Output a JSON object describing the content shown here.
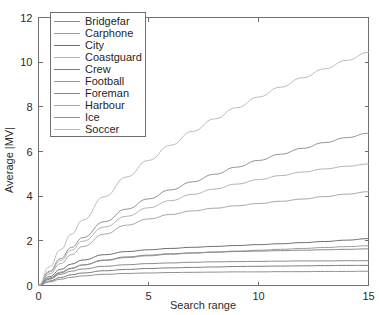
{
  "chart_data": {
    "type": "line",
    "title": "",
    "xlabel": "Search range",
    "ylabel": "Average |MV|",
    "xlim": [
      0,
      15
    ],
    "ylim": [
      0,
      12
    ],
    "xticks": [
      0,
      5,
      10,
      15
    ],
    "yticks": [
      0,
      2,
      4,
      6,
      8,
      10,
      12
    ],
    "grid": false,
    "legend_position": "upper-left-inside",
    "x": [
      0,
      0.5,
      1,
      1.5,
      2,
      3,
      4,
      5,
      6,
      7,
      8,
      9,
      10,
      11,
      12,
      13,
      14,
      15
    ],
    "series": [
      {
        "name": "Bridgefar",
        "color": "#8a8a8a",
        "values": [
          0,
          0.28,
          0.5,
          0.64,
          0.74,
          0.86,
          0.93,
          0.98,
          1.01,
          1.04,
          1.06,
          1.07,
          1.08,
          1.09,
          1.1,
          1.1,
          1.11,
          1.11
        ]
      },
      {
        "name": "Carphone",
        "color": "#9d9d9d",
        "values": [
          0,
          0.34,
          0.6,
          0.78,
          0.92,
          1.12,
          1.25,
          1.33,
          1.4,
          1.45,
          1.5,
          1.54,
          1.58,
          1.62,
          1.66,
          1.7,
          1.74,
          1.78
        ]
      },
      {
        "name": "City",
        "color": "#6e6e6e",
        "values": [
          0,
          0.4,
          0.72,
          0.96,
          1.14,
          1.38,
          1.52,
          1.6,
          1.66,
          1.71,
          1.75,
          1.79,
          1.83,
          1.87,
          1.92,
          1.97,
          2.03,
          2.1
        ]
      },
      {
        "name": "Coastguard",
        "color": "#b4b4b4",
        "values": [
          0,
          0.6,
          1.12,
          1.58,
          1.98,
          2.62,
          3.1,
          3.48,
          3.8,
          4.08,
          4.32,
          4.54,
          4.74,
          4.92,
          5.08,
          5.22,
          5.34,
          5.44
        ]
      },
      {
        "name": "Crew",
        "color": "#7c7c7c",
        "values": [
          0,
          0.2,
          0.36,
          0.48,
          0.56,
          0.66,
          0.72,
          0.76,
          0.79,
          0.81,
          0.83,
          0.85,
          0.86,
          0.87,
          0.88,
          0.89,
          0.9,
          0.9
        ]
      },
      {
        "name": "Football",
        "color": "#949494",
        "values": [
          0,
          0.64,
          1.2,
          1.7,
          2.14,
          2.86,
          3.42,
          3.88,
          4.28,
          4.64,
          4.98,
          5.3,
          5.6,
          5.88,
          6.14,
          6.4,
          6.62,
          6.82
        ]
      },
      {
        "name": "Foreman",
        "color": "#888888",
        "values": [
          0,
          0.3,
          0.56,
          0.76,
          0.92,
          1.14,
          1.28,
          1.36,
          1.42,
          1.46,
          1.49,
          1.52,
          1.54,
          1.56,
          1.58,
          1.6,
          1.62,
          1.64
        ]
      },
      {
        "name": "Harbour",
        "color": "#a8a8a8",
        "values": [
          0,
          0.52,
          0.98,
          1.38,
          1.74,
          2.3,
          2.7,
          2.98,
          3.18,
          3.34,
          3.46,
          3.57,
          3.67,
          3.77,
          3.87,
          3.98,
          4.09,
          4.2
        ]
      },
      {
        "name": "Ice",
        "color": "#8f8f8f",
        "values": [
          0,
          0.16,
          0.28,
          0.37,
          0.43,
          0.5,
          0.54,
          0.56,
          0.58,
          0.59,
          0.6,
          0.61,
          0.61,
          0.62,
          0.62,
          0.63,
          0.63,
          0.64
        ]
      },
      {
        "name": "Soccer",
        "color": "#bdbdbd",
        "values": [
          0,
          0.84,
          1.6,
          2.3,
          2.92,
          3.98,
          4.86,
          5.6,
          6.28,
          6.9,
          7.46,
          7.96,
          8.44,
          8.88,
          9.3,
          9.7,
          10.08,
          10.44
        ]
      }
    ]
  },
  "axes": {
    "x_tick_labels": [
      "0",
      "5",
      "10",
      "15"
    ],
    "y_tick_labels": [
      "0",
      "2",
      "4",
      "6",
      "8",
      "10",
      "12"
    ],
    "x_title": "Search range",
    "y_title": "Average |MV|"
  }
}
